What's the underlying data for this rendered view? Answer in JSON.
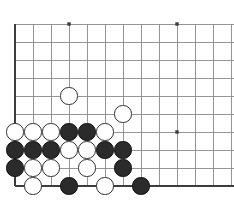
{
  "figure": {
    "kind": "go-board-diagram",
    "background_color": "#ffffff"
  },
  "board": {
    "origin_x": 15,
    "origin_y": 24,
    "spacing": 18,
    "columns": 13,
    "rows": 10,
    "stone_radius": 8.6,
    "line_color": "#8a8a8a",
    "edge_color": "#3d3d3d",
    "line_width": 0.9,
    "edge_width": 2.2,
    "left_edge_col": 0,
    "bottom_edge_row": 9,
    "star_points": [
      {
        "col": 3,
        "row": 0
      },
      {
        "col": 9,
        "row": 0
      },
      {
        "col": 9,
        "row": 6
      }
    ],
    "star_size": 3.4,
    "star_color": "#3d3d3d"
  },
  "stones": [
    {
      "col": 3,
      "row": 4,
      "color": "white"
    },
    {
      "col": 6,
      "row": 5,
      "color": "white"
    },
    {
      "col": 0,
      "row": 6,
      "color": "white"
    },
    {
      "col": 1,
      "row": 6,
      "color": "white"
    },
    {
      "col": 2,
      "row": 6,
      "color": "white"
    },
    {
      "col": 3,
      "row": 6,
      "color": "black"
    },
    {
      "col": 4,
      "row": 6,
      "color": "black"
    },
    {
      "col": 5,
      "row": 6,
      "color": "white"
    },
    {
      "col": 0,
      "row": 7,
      "color": "black"
    },
    {
      "col": 1,
      "row": 7,
      "color": "black"
    },
    {
      "col": 2,
      "row": 7,
      "color": "black"
    },
    {
      "col": 3,
      "row": 7,
      "color": "white"
    },
    {
      "col": 4,
      "row": 7,
      "color": "white"
    },
    {
      "col": 5,
      "row": 7,
      "color": "black"
    },
    {
      "col": 6,
      "row": 7,
      "color": "black"
    },
    {
      "col": 0,
      "row": 8,
      "color": "black"
    },
    {
      "col": 1,
      "row": 8,
      "color": "white"
    },
    {
      "col": 2,
      "row": 8,
      "color": "white"
    },
    {
      "col": 4,
      "row": 8,
      "color": "white"
    },
    {
      "col": 6,
      "row": 8,
      "color": "black"
    },
    {
      "col": 1,
      "row": 9,
      "color": "white"
    },
    {
      "col": 3,
      "row": 9,
      "color": "black"
    },
    {
      "col": 5,
      "row": 9,
      "color": "white"
    },
    {
      "col": 7,
      "row": 9,
      "color": "black"
    }
  ],
  "colors": {
    "black_stone": "#2b2b2b",
    "black_stone_border": "#111111",
    "white_stone": "#ffffff",
    "white_stone_border": "#2e2e2e"
  }
}
